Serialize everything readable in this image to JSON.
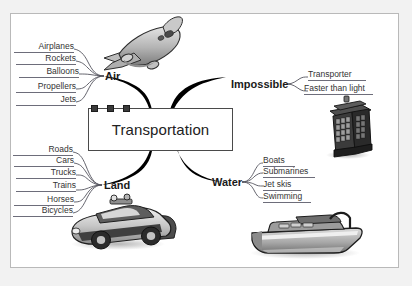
{
  "diagram": {
    "title": "Transportation",
    "center": {
      "label": "Transportation",
      "handles": [
        "handle-left",
        "handle-middle",
        "handle-right"
      ]
    },
    "branches": [
      {
        "id": "air",
        "label": "Air",
        "side": "left",
        "align": "right",
        "clipart": "airplane-clipart",
        "children": [
          {
            "label": "Airplanes"
          },
          {
            "label": "Rockets"
          },
          {
            "label": "Balloons"
          },
          {
            "label": "Propellers"
          },
          {
            "label": "Jets"
          }
        ]
      },
      {
        "id": "land",
        "label": "Land",
        "side": "left",
        "align": "right",
        "clipart": "police-car-clipart",
        "children": [
          {
            "label": "Roads"
          },
          {
            "label": "Cars"
          },
          {
            "label": "Trucks"
          },
          {
            "label": "Trains"
          },
          {
            "label": "Horses"
          },
          {
            "label": "Bicycles"
          }
        ]
      },
      {
        "id": "impossible",
        "label": "Impossible",
        "side": "right",
        "align": "left",
        "clipart": "police-box-clipart",
        "children": [
          {
            "label": "Transporter"
          },
          {
            "label": "Faster than light"
          }
        ]
      },
      {
        "id": "water",
        "label": "Water",
        "side": "right",
        "align": "left",
        "clipart": "speedboat-clipart",
        "children": [
          {
            "label": "Boats"
          },
          {
            "label": "Submarines"
          },
          {
            "label": "Jet skis"
          },
          {
            "label": "Swimming"
          }
        ]
      }
    ],
    "colors": {
      "page_background": "#f2f2f2",
      "panel_background": "#ffffff",
      "panel_border": "#b9b9b9",
      "branch_stroke": "#000000",
      "leaf_stroke": "#55555f",
      "leaf_underline": "#6d6d7a",
      "node_border": "#4a4a4a",
      "text": "#2b2b2b",
      "clipart_light": "#d9d9d9",
      "clipart_mid": "#9a9a9a",
      "clipart_dark": "#3c3c3c"
    }
  }
}
